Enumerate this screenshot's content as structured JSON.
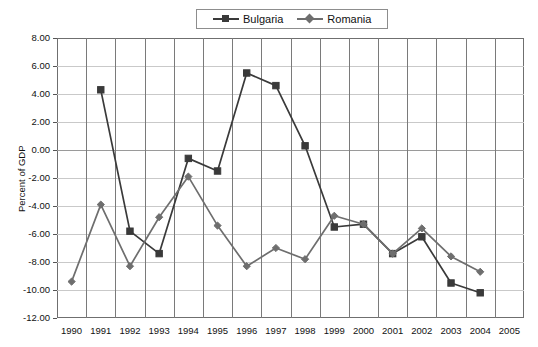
{
  "chart_data": {
    "type": "line",
    "title": "",
    "xlabel": "",
    "ylabel": "Percent of GDP",
    "ylim": [
      -12,
      8
    ],
    "ytick_step": 2,
    "yticks": [
      "8.00",
      "6.00",
      "4.00",
      "2.00",
      "0.00",
      "-2.00",
      "-4.00",
      "-6.00",
      "-8.00",
      "-10.00",
      "-12.00"
    ],
    "categories": [
      "1990",
      "1991",
      "1992",
      "1993",
      "1994",
      "1995",
      "1996",
      "1997",
      "1998",
      "1999",
      "2000",
      "2001",
      "2002",
      "2003",
      "2004",
      "2005"
    ],
    "grid": true,
    "legend_position": "top-center",
    "series": [
      {
        "name": "Bulgaria",
        "color": "#3a3a3a",
        "marker": "square",
        "x": [
          "1991",
          "1992",
          "1993",
          "1994",
          "1995",
          "1996",
          "1997",
          "1998",
          "1999",
          "2000",
          "2001",
          "2002",
          "2003",
          "2004"
        ],
        "values": [
          4.3,
          -5.8,
          -7.4,
          -0.6,
          -1.5,
          5.5,
          4.6,
          0.3,
          -5.5,
          -5.3,
          -7.4,
          -6.2,
          -9.5,
          -10.2
        ]
      },
      {
        "name": "Romania",
        "color": "#6e6e6e",
        "marker": "diamond",
        "x": [
          "1990",
          "1991",
          "1992",
          "1993",
          "1994",
          "1995",
          "1996",
          "1997",
          "1998",
          "1999",
          "2000",
          "2001",
          "2002",
          "2003",
          "2004"
        ],
        "values": [
          -9.4,
          -3.9,
          -8.3,
          -4.8,
          -1.9,
          -5.4,
          -8.3,
          -7.0,
          -7.8,
          -4.7,
          -5.3,
          -7.4,
          -5.6,
          -7.6,
          -8.7
        ]
      }
    ]
  },
  "legend": {
    "items": [
      {
        "label": "Bulgaria"
      },
      {
        "label": "Romania"
      }
    ]
  }
}
